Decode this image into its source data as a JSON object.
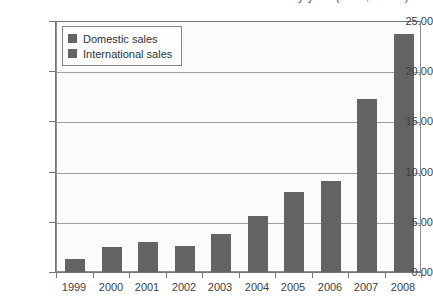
{
  "chart_data": {
    "type": "bar",
    "title": "Sales by year (USD, billion)",
    "xlabel": "",
    "ylabel": "",
    "categories": [
      "1999",
      "2000",
      "2001",
      "2002",
      "2003",
      "2004",
      "2005",
      "2006",
      "2007",
      "2008"
    ],
    "series": [
      {
        "name": "Domestic sales",
        "color": "#636363",
        "values": [
          1.4,
          2.6,
          3.1,
          2.7,
          3.9,
          5.7,
          8.1,
          9.2,
          17.3,
          23.8
        ]
      }
    ],
    "legend": {
      "position": "top-left-inside",
      "entries": [
        {
          "label": "Domestic sales",
          "color": "#636363"
        },
        {
          "label": "International sales",
          "color": "#636363"
        }
      ]
    },
    "ylim": [
      0,
      25
    ],
    "ytick_values": [
      0,
      5,
      10,
      15,
      20,
      25
    ],
    "ytick_labels": [
      "0.00",
      "5.00",
      "10.00",
      "15.00",
      "20.00",
      "25.00"
    ],
    "grid": true,
    "grid_axis": "y"
  }
}
